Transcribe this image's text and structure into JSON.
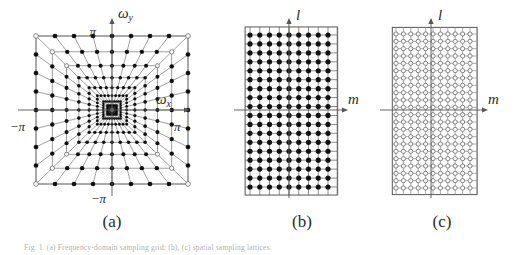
{
  "figure": {
    "caption": "Fig. 1. (a) Frequency-domain sampling grid; (b), (c) spatial sampling lattices.",
    "panels": [
      {
        "id": "a",
        "label": "(a)",
        "type": "concentric-square-polar-grid",
        "axes": {
          "x_label": "ωx",
          "x_label_base": "ω",
          "x_label_sub": "x",
          "y_label_base": "ω",
          "y_label_sub": "y",
          "tick_top": "π",
          "tick_bottom": "−π",
          "tick_left": "−π",
          "tick_right": "π"
        },
        "rings": 9,
        "spokes_per_quadrant": 8,
        "marker_style": "filled",
        "description": "Nested squares with radially emanating spokes; dots at every ring/spoke intersection, becoming dense and dark near the origin."
      },
      {
        "id": "b",
        "label": "(b)",
        "type": "rectangular-lattice",
        "axes": {
          "vertical_label": "l",
          "horizontal_label": "m"
        },
        "columns": 9,
        "rows": 18,
        "marker_style": "filled",
        "marker_radius": 2.6
      },
      {
        "id": "c",
        "label": "(c)",
        "type": "rectangular-lattice",
        "axes": {
          "vertical_label": "l",
          "horizontal_label": "m"
        },
        "columns": 11,
        "rows": 22,
        "marker_style": "open",
        "marker_radius": 2.1
      }
    ]
  },
  "colors": {
    "ink": "#111111",
    "grid": "#777777",
    "axis": "#555555",
    "background": "#ffffff"
  }
}
